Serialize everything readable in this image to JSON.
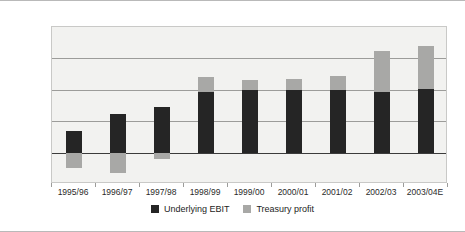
{
  "chart_data": {
    "type": "bar",
    "stacked": true,
    "title": "",
    "xlabel": "",
    "ylabel": "",
    "categories": [
      "1995/96",
      "1996/97",
      "1997/98",
      "1998/99",
      "1999/00",
      "2000/01",
      "2001/02",
      "2002/03",
      "2003/04E"
    ],
    "series": [
      {
        "name": "Underlying EBIT",
        "color": "#252525",
        "values": [
          3.5,
          6.2,
          7.3,
          9.7,
          9.9,
          10.0,
          9.9,
          9.7,
          10.1
        ]
      },
      {
        "name": "Treasury profit",
        "color": "#a8a8a6",
        "values": [
          -2.5,
          -3.2,
          -1.0,
          2.3,
          1.7,
          1.7,
          2.3,
          6.5,
          6.8
        ]
      }
    ],
    "stack_tops": [
      3.5,
      6.2,
      7.3,
      12.0,
      11.6,
      11.6,
      12.2,
      16.2,
      16.9
    ],
    "yticks": [
      "20%",
      "15%",
      "10%",
      "5%",
      "0%",
      "-5%"
    ],
    "ytick_values": [
      20,
      15,
      10,
      5,
      0,
      -5
    ],
    "ylim": [
      -5,
      20
    ],
    "yunit": "%",
    "grid": true,
    "legend_position": "bottom"
  },
  "legend": {
    "items": [
      {
        "label": "Underlying EBIT"
      },
      {
        "label": "Treasury profit"
      }
    ]
  }
}
